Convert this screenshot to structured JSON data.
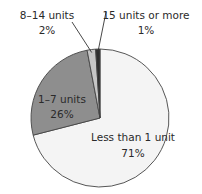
{
  "chart_data": {
    "type": "pie",
    "title": "",
    "start": "top",
    "direction": "clockwise",
    "slices": [
      {
        "label": "Less than 1 unit",
        "value": 71,
        "value_label": "71%",
        "color": "#f4f4f4"
      },
      {
        "label": "1–7 units",
        "value": 26,
        "value_label": "26%",
        "color": "#8e8e8e"
      },
      {
        "label": "8–14 units",
        "value": 2,
        "value_label": "2%",
        "color": "#c6c6c6"
      },
      {
        "label": "15 units or more",
        "value": 1,
        "value_label": "1%",
        "color": "#2e2e2e"
      }
    ],
    "outline_color": "#444444",
    "label_color": "#2a2a2a"
  }
}
